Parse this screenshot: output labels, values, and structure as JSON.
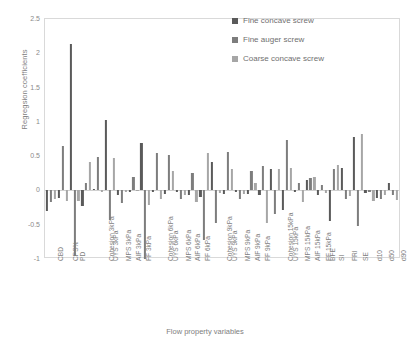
{
  "chart_data": {
    "type": "bar",
    "title": "",
    "xlabel": "Flow property variables",
    "ylabel": "Regregsion coefficients",
    "ylim": [
      -1,
      2.5
    ],
    "ytick_labels": [
      "2.5",
      "2",
      "1.5",
      "1",
      "0.5",
      "0",
      "-0.5",
      "-1"
    ],
    "ytick_values": [
      2.5,
      2,
      1.5,
      1,
      0.5,
      0,
      -0.5,
      -1
    ],
    "grid": false,
    "legend_position": "top-right",
    "categories": [
      "CBD",
      "CPS%",
      "PD",
      "Cohesion 3kPa",
      "UYS 3kPa",
      "MPS 3kPa",
      "AIF 3kPa",
      "FF 3kPa",
      "Cohesion 6kPa",
      "UYS 6kPa",
      "MPS 6kPa",
      "AIF 6kPa",
      "FF 6kPa",
      "Cohesion 9kPa",
      "UYS 9kPa",
      "MPS 9kPa",
      "AIF 9kPa",
      "FF 9kPa",
      "Cohesion 15kPa",
      "UYS 15kPa",
      "MPS 15kPa",
      "AIF 15kPa",
      "FF 15kPa",
      "BFE",
      "SI",
      "FRI",
      "SE",
      "d10",
      "d50",
      "d90"
    ],
    "series": [
      {
        "name": "Fine concave screw",
        "color": "#5a5a5a",
        "values": [
          -0.3,
          -0.11,
          2.13,
          -0.22,
          0.02,
          1.02,
          -0.06,
          -0.02,
          0.69,
          -0.03,
          -0.05,
          -0.02,
          -0.07,
          -0.1,
          0.41,
          -0.05,
          -0.03,
          -0.05,
          -0.06,
          0.31,
          -0.28,
          -0.03,
          0.15,
          -0.06,
          -0.45,
          0.33,
          0.78,
          -0.04,
          -0.11,
          0.11
        ]
      },
      {
        "name": "Fine auger screw",
        "color": "#7d7d7d",
        "values": [
          -0.17,
          0.65,
          -0.96,
          0.11,
          0.49,
          -0.43,
          -0.19,
          0.2,
          -1.0,
          0.54,
          0.52,
          -0.13,
          0.25,
          -0.72,
          -0.47,
          0.56,
          -0.12,
          0.29,
          0.36,
          -0.34,
          0.73,
          0.11,
          0.18,
          0.08,
          0.31,
          -0.13,
          -0.52,
          -0.02,
          -0.12,
          -0.06
        ]
      },
      {
        "name": "Coarse concave screw",
        "color": "#a6a6a6",
        "values": [
          -0.13,
          -0.16,
          -0.16,
          0.42,
          -0.02,
          0.47,
          -0.03,
          -0.01,
          -0.21,
          -0.13,
          0.28,
          -0.06,
          -0.17,
          0.54,
          -0.04,
          0.31,
          -0.05,
          0.11,
          -0.47,
          0.31,
          0.33,
          -0.17,
          0.19,
          -0.04,
          0.37,
          -0.08,
          0.82,
          -0.15,
          -0.06,
          -0.14
        ]
      }
    ]
  },
  "legend": {
    "items": [
      {
        "label": "Fine concave screw",
        "color": "#5a5a5a"
      },
      {
        "label": "Fine auger screw",
        "color": "#7d7d7d"
      },
      {
        "label": "Coarse concave screw",
        "color": "#a6a6a6"
      }
    ]
  }
}
